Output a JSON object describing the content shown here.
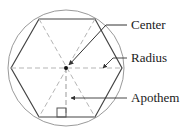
{
  "diagram": {
    "labels": {
      "center": "Center",
      "radius": "Radius",
      "apothem": "Apothem"
    },
    "colors": {
      "outline": "#333333",
      "circle": "#9a9a9a",
      "dashed": "#b0b0b0",
      "leader": "#333333"
    }
  }
}
